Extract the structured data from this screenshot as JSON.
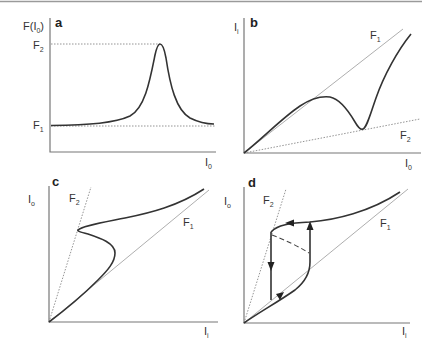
{
  "figure": {
    "top_rule_color": "#9a9a9a",
    "panels": [
      {
        "id": "a",
        "label": "a",
        "y_axis_label": "F(I",
        "y_axis_label_sub": "0",
        "y_axis_label_close": ")",
        "x_axis_label": "I",
        "x_axis_label_sub": "0",
        "levels": [
          {
            "name": "F",
            "sub": "2"
          },
          {
            "name": "F",
            "sub": "1"
          }
        ],
        "description": "Resonant peak of F(I0) rising from F1 baseline to F2 maximum"
      },
      {
        "id": "b",
        "label": "b",
        "y_axis_label": "I",
        "y_axis_label_sub": "i",
        "x_axis_label": "I",
        "x_axis_label_sub": "0",
        "lines": [
          {
            "name": "F",
            "sub": "1"
          },
          {
            "name": "F",
            "sub": "2"
          }
        ],
        "description": "Input intensity vs output intensity between slope lines F1 and F2"
      },
      {
        "id": "c",
        "label": "c",
        "y_axis_label": "I",
        "y_axis_label_sub": "o",
        "x_axis_label": "I",
        "x_axis_label_sub": "i",
        "lines": [
          {
            "name": "F",
            "sub": "2"
          },
          {
            "name": "F",
            "sub": "1"
          }
        ],
        "description": "S-shaped output vs input curve between F1 and F2"
      },
      {
        "id": "d",
        "label": "d",
        "y_axis_label": "I",
        "y_axis_label_sub": "o",
        "x_axis_label": "I",
        "x_axis_label_sub": "i",
        "lines": [
          {
            "name": "F",
            "sub": "2"
          },
          {
            "name": "F",
            "sub": "1"
          }
        ],
        "description": "Bistable hysteresis loop with arrows, unstable branch dashed"
      }
    ]
  }
}
